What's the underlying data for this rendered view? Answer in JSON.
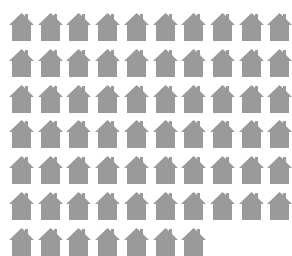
{
  "chart_data": {
    "type": "pictograph",
    "title": "",
    "icon": "house-icon",
    "icon_color": "#9a9a9a",
    "background_color": "#ffffff",
    "count": 67,
    "columns": 10,
    "rows": 7,
    "row_counts": [
      10,
      10,
      10,
      10,
      10,
      10,
      7
    ],
    "legend": [],
    "xlabel": "",
    "ylabel": ""
  },
  "layout": {
    "origin_x": 9,
    "origin_y": 11,
    "col_step": 28.7,
    "row_step": 35.8
  }
}
